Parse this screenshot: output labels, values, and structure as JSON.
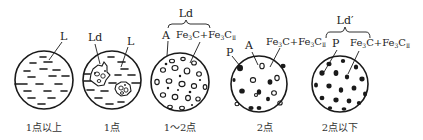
{
  "figure": {
    "panels": [
      {
        "id": "p1",
        "caption": "1点以上",
        "labels": [
          {
            "text": "L",
            "phase": "liquid"
          }
        ]
      },
      {
        "id": "p2",
        "caption": "1点",
        "labels": [
          {
            "text": "Ld",
            "phase": "ledeburite"
          },
          {
            "text": "L",
            "phase": "liquid"
          }
        ]
      },
      {
        "id": "p3",
        "caption": "1～2点",
        "group_label": "Ld",
        "labels": [
          {
            "text": "A",
            "phase": "austenite"
          },
          {
            "text": "Fe",
            "sub1": "3",
            "mid": "C+Fe",
            "sub2": "3",
            "end": "C",
            "sub3": "Ⅱ"
          }
        ]
      },
      {
        "id": "p4",
        "caption": "2点",
        "labels": [
          {
            "text": "P",
            "phase": "pearlite"
          },
          {
            "text": "A",
            "phase": "austenite"
          },
          {
            "text": "Fe",
            "sub1": "3",
            "mid": "C+Fe",
            "sub2": "3",
            "end": "C",
            "sub3": "Ⅱ"
          }
        ]
      },
      {
        "id": "p5",
        "caption": "2点以下",
        "group_label": "Ld′",
        "labels": [
          {
            "text": "P",
            "phase": "pearlite"
          },
          {
            "text": "Fe",
            "sub1": "3",
            "mid": "C+Fe",
            "sub2": "3",
            "end": "C",
            "sub3": "Ⅱ"
          }
        ]
      }
    ]
  },
  "colors": {
    "stroke": "#1a1a1a",
    "fill_dark": "#1a1a1a",
    "background": "#ffffff",
    "text": "#222222"
  }
}
